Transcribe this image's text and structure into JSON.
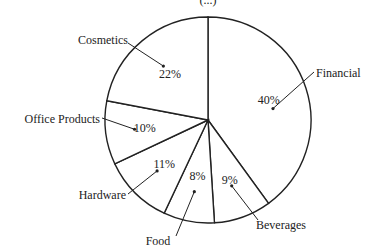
{
  "chart_data": {
    "type": "pie",
    "title": "",
    "subtitle": "(...)",
    "categories": [
      "Financial",
      "Beverages",
      "Food",
      "Hardware",
      "Office Products",
      "Cosmetics"
    ],
    "values": [
      40,
      9,
      8,
      11,
      10,
      22
    ],
    "value_labels": [
      "40%",
      "9%",
      "8%",
      "11%",
      "10%",
      "22%"
    ],
    "start_angle_deg": 0,
    "direction": "clockwise",
    "legend": "none (leader-line callouts)",
    "colors": {
      "stroke": "#222222",
      "fill": "#ffffff"
    }
  }
}
